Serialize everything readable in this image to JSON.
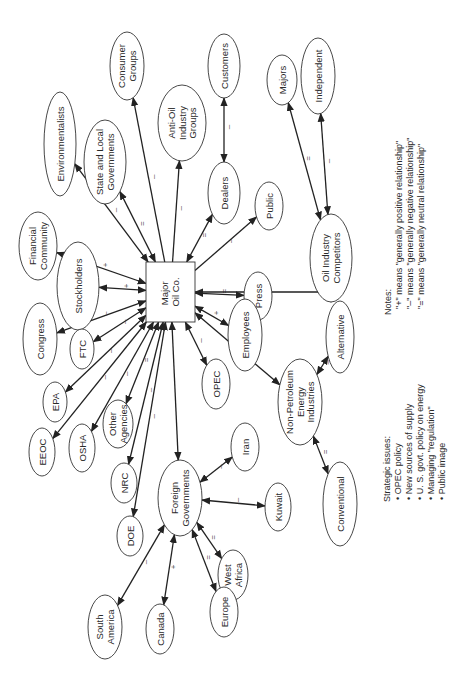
{
  "diagram": {
    "orientation": "rotated -90deg",
    "center": {
      "id": "major_oil",
      "label": [
        "Major",
        "Oil Co."
      ]
    },
    "nodes": [
      {
        "id": "consumer_groups",
        "label": [
          "Consumer",
          "Groups"
        ],
        "cx": 127,
        "cy": 66,
        "rx": 17,
        "ry": 34
      },
      {
        "id": "environmentalists",
        "label": [
          "Environmentalists"
        ],
        "cx": 60,
        "cy": 144,
        "rx": 16,
        "ry": 52
      },
      {
        "id": "state_local",
        "label": [
          "State and Local",
          "Governments"
        ],
        "cx": 105,
        "cy": 162,
        "rx": 21,
        "ry": 42
      },
      {
        "id": "anti_oil",
        "label": [
          "Anti-Oil",
          "Industry",
          "Groups"
        ],
        "cx": 182,
        "cy": 123,
        "rx": 24,
        "ry": 38
      },
      {
        "id": "customers",
        "label": [
          "Customers"
        ],
        "cx": 224,
        "cy": 66,
        "rx": 16,
        "ry": 32
      },
      {
        "id": "dealers",
        "label": [
          "Dealers"
        ],
        "cx": 224,
        "cy": 193,
        "rx": 16,
        "ry": 31
      },
      {
        "id": "public",
        "label": [
          "Public"
        ],
        "cx": 269,
        "cy": 206,
        "rx": 14,
        "ry": 24
      },
      {
        "id": "press",
        "label": [
          "Press"
        ],
        "cx": 258,
        "cy": 296,
        "rx": 14,
        "ry": 24
      },
      {
        "id": "employees",
        "label": [
          "Employees"
        ],
        "cx": 245,
        "cy": 335,
        "rx": 17,
        "ry": 36
      },
      {
        "id": "oil_competitors",
        "label": [
          "Oil Industry",
          "Competitors"
        ],
        "cx": 331,
        "cy": 258,
        "rx": 21,
        "ry": 44
      },
      {
        "id": "majors",
        "label": [
          "Majors"
        ],
        "cx": 282,
        "cy": 80,
        "rx": 15,
        "ry": 25
      },
      {
        "id": "independent",
        "label": [
          "Independent"
        ],
        "cx": 318,
        "cy": 76,
        "rx": 17,
        "ry": 38
      },
      {
        "id": "financial",
        "label": [
          "Financial",
          "Community"
        ],
        "cx": 38,
        "cy": 246,
        "rx": 19,
        "ry": 34
      },
      {
        "id": "stockholders",
        "label": [
          "Stockholders"
        ],
        "cx": 78,
        "cy": 286,
        "rx": 21,
        "ry": 44
      },
      {
        "id": "congress",
        "label": [
          "Congress"
        ],
        "cx": 40,
        "cy": 339,
        "rx": 17,
        "ry": 36
      },
      {
        "id": "ftc",
        "label": [
          "FTC"
        ],
        "cx": 82,
        "cy": 349,
        "rx": 12,
        "ry": 20
      },
      {
        "id": "epa",
        "label": [
          "EPA"
        ],
        "cx": 55,
        "cy": 402,
        "rx": 12,
        "ry": 20
      },
      {
        "id": "eeoc",
        "label": [
          "EEOC"
        ],
        "cx": 42,
        "cy": 452,
        "rx": 13,
        "ry": 24
      },
      {
        "id": "osha",
        "label": [
          "OSHA"
        ],
        "cx": 82,
        "cy": 448,
        "rx": 13,
        "ry": 24
      },
      {
        "id": "other_agencies",
        "label": [
          "Other",
          "Agencies"
        ],
        "cx": 118,
        "cy": 424,
        "rx": 15,
        "ry": 24
      },
      {
        "id": "opec",
        "label": [
          "OPEC"
        ],
        "cx": 216,
        "cy": 384,
        "rx": 14,
        "ry": 25
      },
      {
        "id": "nrc",
        "label": [
          "NRC"
        ],
        "cx": 124,
        "cy": 483,
        "rx": 13,
        "ry": 20
      },
      {
        "id": "doe",
        "label": [
          "DOE"
        ],
        "cx": 130,
        "cy": 536,
        "rx": 13,
        "ry": 20
      },
      {
        "id": "foreign_govts",
        "label": [
          "Foreign",
          "Governments"
        ],
        "cx": 180,
        "cy": 498,
        "rx": 22,
        "ry": 38
      },
      {
        "id": "iran",
        "label": [
          "Iran"
        ],
        "cx": 245,
        "cy": 447,
        "rx": 14,
        "ry": 24
      },
      {
        "id": "kuwait",
        "label": [
          "Kuwait"
        ],
        "cx": 278,
        "cy": 507,
        "rx": 13,
        "ry": 24
      },
      {
        "id": "west_africa",
        "label": [
          "West",
          "Africa"
        ],
        "cx": 233,
        "cy": 575,
        "rx": 15,
        "ry": 25
      },
      {
        "id": "europe",
        "label": [
          "Europe"
        ],
        "cx": 224,
        "cy": 612,
        "rx": 14,
        "ry": 25
      },
      {
        "id": "canada",
        "label": [
          "Canada"
        ],
        "cx": 160,
        "cy": 629,
        "rx": 14,
        "ry": 25
      },
      {
        "id": "south_america",
        "label": [
          "South",
          "America"
        ],
        "cx": 105,
        "cy": 627,
        "rx": 17,
        "ry": 32
      },
      {
        "id": "non_petroleum",
        "label": [
          "Non-Petroleum",
          "Energy",
          "Industries"
        ],
        "cx": 300,
        "cy": 402,
        "rx": 22,
        "ry": 43
      },
      {
        "id": "alternative",
        "label": [
          "Alternative"
        ],
        "cx": 340,
        "cy": 337,
        "rx": 14,
        "ry": 36
      },
      {
        "id": "conventional",
        "label": [
          "Conventional"
        ],
        "cx": 340,
        "cy": 504,
        "rx": 17,
        "ry": 42
      }
    ],
    "edges": [
      {
        "from": "major_oil",
        "to": "consumer_groups",
        "sign": "–",
        "dir": "to"
      },
      {
        "from": "major_oil",
        "to": "environmentalists",
        "sign": "–",
        "dir": "both"
      },
      {
        "from": "major_oil",
        "to": "state_local",
        "sign": "=",
        "dir": "both"
      },
      {
        "from": "major_oil",
        "to": "anti_oil",
        "sign": "–",
        "dir": "to"
      },
      {
        "from": "customers",
        "to": "dealers",
        "sign": "–",
        "dir": "both"
      },
      {
        "from": "major_oil",
        "to": "dealers",
        "sign": "=",
        "dir": "both"
      },
      {
        "from": "major_oil",
        "to": "public",
        "sign": "–",
        "dir": "to"
      },
      {
        "from": "major_oil",
        "to": "press",
        "sign": "=",
        "dir": "both"
      },
      {
        "from": "major_oil",
        "to": "employees",
        "sign": "+",
        "dir": "both"
      },
      {
        "from": "major_oil",
        "to": "oil_competitors",
        "sign": "",
        "dir": "both",
        "elbow": true
      },
      {
        "from": "oil_competitors",
        "to": "majors",
        "sign": "=",
        "dir": "both"
      },
      {
        "from": "oil_competitors",
        "to": "independent",
        "sign": "–",
        "dir": "both"
      },
      {
        "from": "major_oil",
        "to": "financial",
        "sign": "+",
        "dir": "both"
      },
      {
        "from": "major_oil",
        "to": "stockholders",
        "sign": "+",
        "dir": "both"
      },
      {
        "from": "major_oil",
        "to": "congress",
        "sign": "–",
        "dir": "both"
      },
      {
        "from": "major_oil",
        "to": "ftc",
        "sign": "–",
        "dir": "both"
      },
      {
        "from": "major_oil",
        "to": "epa",
        "sign": "–",
        "dir": "both"
      },
      {
        "from": "major_oil",
        "to": "eeoc",
        "sign": "–",
        "dir": "both"
      },
      {
        "from": "major_oil",
        "to": "osha",
        "sign": "–",
        "dir": "both"
      },
      {
        "from": "major_oil",
        "to": "other_agencies",
        "sign": "=",
        "dir": "both"
      },
      {
        "from": "major_oil",
        "to": "nrc",
        "sign": "–",
        "dir": "both"
      },
      {
        "from": "major_oil",
        "to": "doe",
        "sign": "–",
        "dir": "both"
      },
      {
        "from": "major_oil",
        "to": "foreign_govts",
        "sign": "",
        "dir": "both"
      },
      {
        "from": "major_oil",
        "to": "opec",
        "sign": "–",
        "dir": "both"
      },
      {
        "from": "major_oil",
        "to": "non_petroleum",
        "sign": "",
        "dir": "both"
      },
      {
        "from": "foreign_govts",
        "to": "iran",
        "sign": "–",
        "dir": "both"
      },
      {
        "from": "foreign_govts",
        "to": "kuwait",
        "sign": "–",
        "dir": "both"
      },
      {
        "from": "foreign_govts",
        "to": "west_africa",
        "sign": "=",
        "dir": "both"
      },
      {
        "from": "foreign_govts",
        "to": "europe",
        "sign": "=",
        "dir": "both"
      },
      {
        "from": "foreign_govts",
        "to": "canada",
        "sign": "+",
        "dir": "both"
      },
      {
        "from": "foreign_govts",
        "to": "south_america",
        "sign": "–",
        "dir": "both"
      },
      {
        "from": "non_petroleum",
        "to": "alternative",
        "sign": "–",
        "dir": "both"
      },
      {
        "from": "non_petroleum",
        "to": "conventional",
        "sign": "=",
        "dir": "both"
      }
    ]
  },
  "notes": {
    "heading": "Notes:",
    "lines": [
      "\"+\" means \"generally positive relationship\"",
      "\"–\" means \"generally negative relationship\"",
      "\"=\" means \"generally neutral relationship\""
    ]
  },
  "strategic_issues": {
    "heading": "Strategic issues:",
    "items": [
      "• OPEC policy",
      "• New sources of supply",
      "• U. S. govt. policy on energy",
      "• Managing \"regulation\"",
      "• Public image"
    ]
  }
}
